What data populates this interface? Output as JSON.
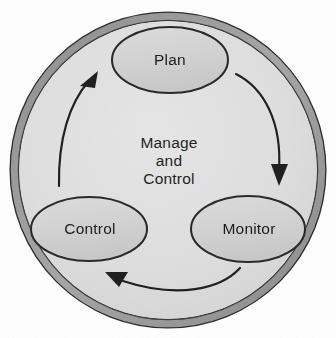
{
  "diagram": {
    "type": "cycle",
    "title": "Manage and Control",
    "center_text": {
      "line1": "Manage",
      "line2": "and",
      "line3": "Control"
    },
    "nodes": [
      {
        "id": "plan",
        "label": "Plan",
        "cx": 170,
        "cy": 60,
        "rx": 58,
        "ry": 33
      },
      {
        "id": "monitor",
        "label": "Monitor",
        "cx": 248,
        "cy": 229,
        "rx": 57,
        "ry": 33
      },
      {
        "id": "control",
        "label": "Control",
        "cx": 89,
        "cy": 229,
        "rx": 58,
        "ry": 32
      }
    ],
    "arrows": [
      {
        "id": "plan-to-monitor",
        "from": "Plan",
        "to": "Monitor"
      },
      {
        "id": "monitor-to-control",
        "from": "Monitor",
        "to": "Control"
      },
      {
        "id": "control-to-plan",
        "from": "Control",
        "to": "Plan"
      }
    ],
    "outer_ring": {
      "cx": 168,
      "cy": 170,
      "r": 153,
      "band_width": 8
    },
    "colors": {
      "page_background": "#ffffff",
      "ring_band": "#9e9e9e",
      "ring_outline": "#2b2b2b",
      "inner_fill": "#dedede",
      "node_fill": "#d2d2d2",
      "node_outline": "#262626",
      "arrow": "#1d1d1d",
      "text": "#17181a"
    }
  }
}
